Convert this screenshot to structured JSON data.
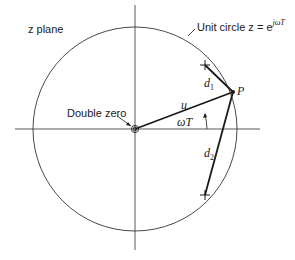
{
  "diagram": {
    "plane_label": "z plane",
    "unit_circle_label": "Unit circle z = e",
    "unit_circle_exponent": "jωT",
    "double_zero_label": "Double zero",
    "point_label": "P",
    "vector_u_label": "u",
    "angle_label": "ωT",
    "d1_label": "d",
    "d1_sub": "1",
    "d2_label": "d",
    "d2_sub": "2",
    "colors": {
      "line": "#1a1a1a",
      "thin": "#444444",
      "background": "#ffffff"
    },
    "geometry": {
      "center": [
        135,
        129
      ],
      "radius": 102,
      "point_P": [
        233,
        92
      ],
      "pole_upper": [
        205,
        65
      ],
      "pole_lower": [
        205,
        195
      ]
    }
  }
}
